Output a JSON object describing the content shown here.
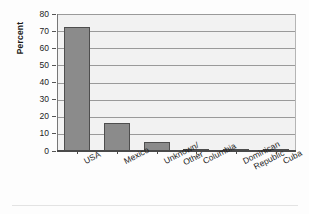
{
  "chart_data": {
    "type": "bar",
    "title": "",
    "xlabel": "",
    "ylabel": "Percent",
    "categories": [
      "USA",
      "Mexico",
      "Unknown/ Other",
      "Columbia",
      "Dominican Republic",
      "Cuba"
    ],
    "category_lines": [
      [
        "USA"
      ],
      [
        "Mexico"
      ],
      [
        "Unknown/",
        "Other"
      ],
      [
        "Columbia"
      ],
      [
        "Dominican",
        "Republic"
      ],
      [
        "Cuba"
      ]
    ],
    "values": [
      72.5,
      16.5,
      5.5,
      1.0,
      1.0,
      0.4
    ],
    "ylim": [
      0,
      80
    ],
    "yticks": [
      0,
      10,
      20,
      30,
      40,
      50,
      60,
      70,
      80
    ],
    "ytick_labels": [
      "0",
      "10",
      "20",
      "30",
      "40",
      "50",
      "60",
      "70",
      "80"
    ],
    "grid": true,
    "grid_axis": "y",
    "legend": null,
    "bar_color": "#8b8b8b",
    "bar_edge_color": "#4e4e4e",
    "plot_background": "#f2f2f2",
    "gridline_color": "#9a9a9a",
    "axis_color": "#4a4a4a"
  }
}
